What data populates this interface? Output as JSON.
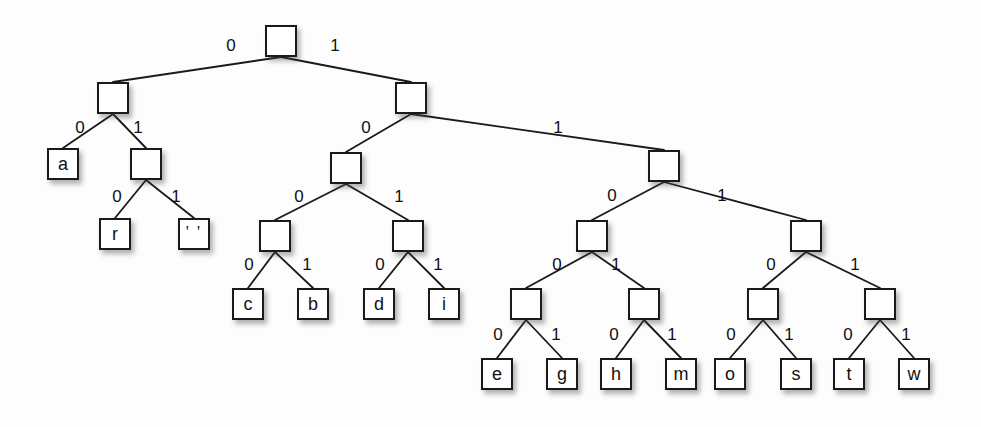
{
  "diagram": {
    "type": "binary-tree",
    "edge_label_left": "0",
    "edge_label_right": "1",
    "colors": {
      "node_border": "#1a1a1a",
      "node_fill": "#ffffff",
      "edge": "#1a1a1a",
      "text": "#111111",
      "background": "#fdfdfd"
    }
  },
  "nodes": [
    {
      "id": "root",
      "label": "",
      "kind": "internal",
      "x": 265,
      "y": 25,
      "w": 32,
      "h": 32,
      "code": ""
    },
    {
      "id": "n0",
      "label": "",
      "kind": "internal",
      "x": 97,
      "y": 82,
      "w": 32,
      "h": 32,
      "code": "0"
    },
    {
      "id": "n1",
      "label": "",
      "kind": "internal",
      "x": 395,
      "y": 82,
      "w": 32,
      "h": 32,
      "code": "1"
    },
    {
      "id": "leaf_a",
      "label": "a",
      "kind": "leaf",
      "x": 47,
      "y": 148,
      "w": 32,
      "h": 32,
      "code": "00"
    },
    {
      "id": "n01",
      "label": "",
      "kind": "internal",
      "x": 130,
      "y": 148,
      "w": 32,
      "h": 32,
      "code": "01"
    },
    {
      "id": "n10",
      "label": "",
      "kind": "internal",
      "x": 330,
      "y": 152,
      "w": 32,
      "h": 32,
      "code": "10"
    },
    {
      "id": "n11",
      "label": "",
      "kind": "internal",
      "x": 648,
      "y": 150,
      "w": 32,
      "h": 32,
      "code": "11"
    },
    {
      "id": "leaf_r",
      "label": "r",
      "kind": "leaf",
      "x": 99,
      "y": 218,
      "w": 32,
      "h": 32,
      "code": "010"
    },
    {
      "id": "leaf_sp",
      "label": "' '",
      "kind": "leaf",
      "x": 178,
      "y": 218,
      "w": 32,
      "h": 32,
      "code": "011"
    },
    {
      "id": "n100",
      "label": "",
      "kind": "internal",
      "x": 259,
      "y": 220,
      "w": 32,
      "h": 32,
      "code": "100"
    },
    {
      "id": "n101",
      "label": "",
      "kind": "internal",
      "x": 392,
      "y": 220,
      "w": 32,
      "h": 32,
      "code": "101"
    },
    {
      "id": "n110",
      "label": "",
      "kind": "internal",
      "x": 576,
      "y": 220,
      "w": 32,
      "h": 32,
      "code": "110"
    },
    {
      "id": "n111",
      "label": "",
      "kind": "internal",
      "x": 790,
      "y": 220,
      "w": 32,
      "h": 32,
      "code": "111"
    },
    {
      "id": "leaf_c",
      "label": "c",
      "kind": "leaf",
      "x": 232,
      "y": 288,
      "w": 32,
      "h": 32,
      "code": "1000"
    },
    {
      "id": "leaf_b",
      "label": "b",
      "kind": "leaf",
      "x": 297,
      "y": 288,
      "w": 32,
      "h": 32,
      "code": "1001"
    },
    {
      "id": "leaf_d",
      "label": "d",
      "kind": "leaf",
      "x": 363,
      "y": 288,
      "w": 32,
      "h": 32,
      "code": "1010"
    },
    {
      "id": "leaf_i",
      "label": "i",
      "kind": "leaf",
      "x": 428,
      "y": 288,
      "w": 32,
      "h": 32,
      "code": "1011"
    },
    {
      "id": "n1100",
      "label": "",
      "kind": "internal",
      "x": 510,
      "y": 288,
      "w": 32,
      "h": 32,
      "code": "1100"
    },
    {
      "id": "n1101",
      "label": "",
      "kind": "internal",
      "x": 628,
      "y": 288,
      "w": 32,
      "h": 32,
      "code": "1101"
    },
    {
      "id": "n1110",
      "label": "",
      "kind": "internal",
      "x": 747,
      "y": 288,
      "w": 32,
      "h": 32,
      "code": "1110"
    },
    {
      "id": "n1111",
      "label": "",
      "kind": "internal",
      "x": 864,
      "y": 288,
      "w": 32,
      "h": 32,
      "code": "1111"
    },
    {
      "id": "leaf_e",
      "label": "e",
      "kind": "leaf",
      "x": 481,
      "y": 358,
      "w": 32,
      "h": 32,
      "code": "11000"
    },
    {
      "id": "leaf_g",
      "label": "g",
      "kind": "leaf",
      "x": 546,
      "y": 358,
      "w": 32,
      "h": 32,
      "code": "11001"
    },
    {
      "id": "leaf_h",
      "label": "h",
      "kind": "leaf",
      "x": 600,
      "y": 358,
      "w": 32,
      "h": 32,
      "code": "11010"
    },
    {
      "id": "leaf_m",
      "label": "m",
      "kind": "leaf",
      "x": 665,
      "y": 358,
      "w": 32,
      "h": 32,
      "code": "11011"
    },
    {
      "id": "leaf_o",
      "label": "o",
      "kind": "leaf",
      "x": 714,
      "y": 358,
      "w": 32,
      "h": 32,
      "code": "11100"
    },
    {
      "id": "leaf_s",
      "label": "s",
      "kind": "leaf",
      "x": 780,
      "y": 358,
      "w": 32,
      "h": 32,
      "code": "11101"
    },
    {
      "id": "leaf_t",
      "label": "t",
      "kind": "leaf",
      "x": 833,
      "y": 358,
      "w": 32,
      "h": 32,
      "code": "11110"
    },
    {
      "id": "leaf_w",
      "label": "w",
      "kind": "leaf",
      "x": 898,
      "y": 358,
      "w": 32,
      "h": 32,
      "code": "11111"
    }
  ],
  "edges": [
    {
      "from": "root",
      "to": "n0",
      "bit": "0",
      "lx": 231,
      "ly": 45
    },
    {
      "from": "root",
      "to": "n1",
      "bit": "1",
      "lx": 335,
      "ly": 45
    },
    {
      "from": "n0",
      "to": "leaf_a",
      "bit": "0",
      "lx": 80,
      "ly": 127
    },
    {
      "from": "n0",
      "to": "n01",
      "bit": "1",
      "lx": 138,
      "ly": 127
    },
    {
      "from": "n1",
      "to": "n10",
      "bit": "0",
      "lx": 366,
      "ly": 127
    },
    {
      "from": "n1",
      "to": "n11",
      "bit": "1",
      "lx": 558,
      "ly": 127
    },
    {
      "from": "n01",
      "to": "leaf_r",
      "bit": "0",
      "lx": 117,
      "ly": 196
    },
    {
      "from": "n01",
      "to": "leaf_sp",
      "bit": "1",
      "lx": 176,
      "ly": 196
    },
    {
      "from": "n10",
      "to": "n100",
      "bit": "0",
      "lx": 299,
      "ly": 196
    },
    {
      "from": "n10",
      "to": "n101",
      "bit": "1",
      "lx": 399,
      "ly": 196
    },
    {
      "from": "n11",
      "to": "n110",
      "bit": "0",
      "lx": 612,
      "ly": 195
    },
    {
      "from": "n11",
      "to": "n111",
      "bit": "1",
      "lx": 722,
      "ly": 195
    },
    {
      "from": "n100",
      "to": "leaf_c",
      "bit": "0",
      "lx": 249,
      "ly": 264
    },
    {
      "from": "n100",
      "to": "leaf_b",
      "bit": "1",
      "lx": 307,
      "ly": 264
    },
    {
      "from": "n101",
      "to": "leaf_d",
      "bit": "0",
      "lx": 380,
      "ly": 264
    },
    {
      "from": "n101",
      "to": "leaf_i",
      "bit": "1",
      "lx": 438,
      "ly": 264
    },
    {
      "from": "n110",
      "to": "n1100",
      "bit": "0",
      "lx": 557,
      "ly": 264
    },
    {
      "from": "n110",
      "to": "n1101",
      "bit": "1",
      "lx": 616,
      "ly": 264
    },
    {
      "from": "n111",
      "to": "n1110",
      "bit": "0",
      "lx": 771,
      "ly": 264
    },
    {
      "from": "n111",
      "to": "n1111",
      "bit": "1",
      "lx": 855,
      "ly": 264
    },
    {
      "from": "n1100",
      "to": "leaf_e",
      "bit": "0",
      "lx": 498,
      "ly": 334
    },
    {
      "from": "n1100",
      "to": "leaf_g",
      "bit": "1",
      "lx": 556,
      "ly": 334
    },
    {
      "from": "n1101",
      "to": "leaf_h",
      "bit": "0",
      "lx": 614,
      "ly": 334
    },
    {
      "from": "n1101",
      "to": "leaf_m",
      "bit": "1",
      "lx": 672,
      "ly": 334
    },
    {
      "from": "n1110",
      "to": "leaf_o",
      "bit": "0",
      "lx": 731,
      "ly": 334
    },
    {
      "from": "n1110",
      "to": "leaf_s",
      "bit": "1",
      "lx": 789,
      "ly": 334
    },
    {
      "from": "n1111",
      "to": "leaf_t",
      "bit": "0",
      "lx": 848,
      "ly": 334
    },
    {
      "from": "n1111",
      "to": "leaf_w",
      "bit": "1",
      "lx": 906,
      "ly": 334
    }
  ]
}
